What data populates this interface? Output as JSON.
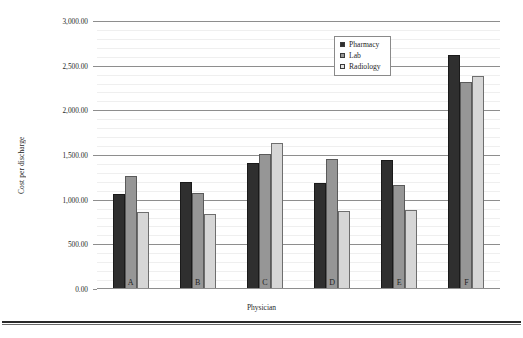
{
  "chart_data": {
    "type": "bar",
    "title": "",
    "xlabel": "Physician",
    "ylabel": "Cost per discharge",
    "categories": [
      "A",
      "B",
      "C",
      "D",
      "E",
      "F"
    ],
    "series": [
      {
        "name": "Pharmacy",
        "color": "#2f2f2f",
        "values": [
          1060,
          1200,
          1410,
          1190,
          1440,
          2620
        ]
      },
      {
        "name": "Lab",
        "color": "#969696",
        "values": [
          1270,
          1080,
          1510,
          1450,
          1160,
          2320
        ]
      },
      {
        "name": "Radiology",
        "color": "#d6d6d6",
        "values": [
          860,
          840,
          1640,
          870,
          890,
          2380
        ]
      }
    ],
    "ylim": [
      0,
      3000
    ],
    "ytick_labels": [
      "0.00",
      "500.00",
      "1,000.00",
      "1,500.00",
      "2,000.00",
      "2,500.00",
      "3,000.00"
    ],
    "ytick_values": [
      0,
      500,
      1000,
      1500,
      2000,
      2500,
      3000
    ],
    "y_minor_interval": 100,
    "grid": true,
    "legend_position": "upper-center-right",
    "legend_entries": [
      "Pharmacy",
      "Lab",
      "Radiology"
    ]
  }
}
